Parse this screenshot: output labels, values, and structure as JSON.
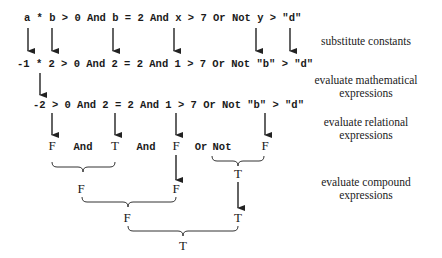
{
  "expressions": {
    "original": "a * b > 0 And b = 2 And x > 7 Or Not y > \"d\"",
    "substituted": "-1 * 2 > 0 And 2 = 2 And 1 > 7 Or Not \"b\" > \"d\"",
    "math_evaluated": "-2 > 0 And 2 = 2 And 1 > 7 Or Not \"b\" > \"d\""
  },
  "relational_row": {
    "v1": "F",
    "op1": "And",
    "v2": "T",
    "op2": "And",
    "v3": "F",
    "op3": "Or",
    "op4": "Not",
    "v4": "F"
  },
  "compound": {
    "not_result": "T",
    "and1_result": "F",
    "passthrough_F": "F",
    "and2_result": "F",
    "passthrough_T": "T",
    "final_result": "T"
  },
  "labels": {
    "step1": "substitute constants",
    "step2_line1": "evaluate mathematical",
    "step2_line2": "expressions",
    "step3_line1": "evaluate relational",
    "step3_line2": "expressions",
    "step4_line1": "evaluate compound",
    "step4_line2": "expressions"
  }
}
